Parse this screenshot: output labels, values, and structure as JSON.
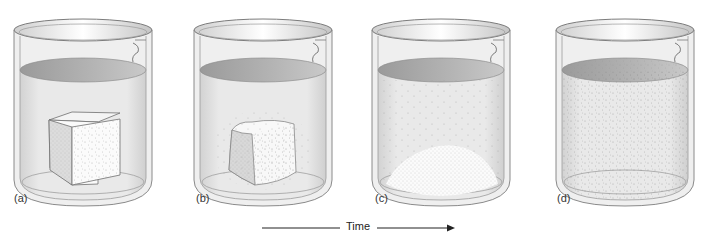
{
  "figure": {
    "panels": [
      {
        "label": "(a)",
        "state": "intact-cube"
      },
      {
        "label": "(b)",
        "state": "cube-partially-dissolving"
      },
      {
        "label": "(c)",
        "state": "mound-of-particles-on-bottom"
      },
      {
        "label": "(d)",
        "state": "fully-dissolved"
      }
    ],
    "time_axis": {
      "label": "Time",
      "direction": "left-to-right"
    }
  },
  "colors": {
    "liquid": "#e6e6e6",
    "liquid_surface": "#a9a9a9",
    "glass_outline": "#8a8a8a",
    "solid": "#f7f7f7",
    "particle": "#9a9a9a"
  }
}
